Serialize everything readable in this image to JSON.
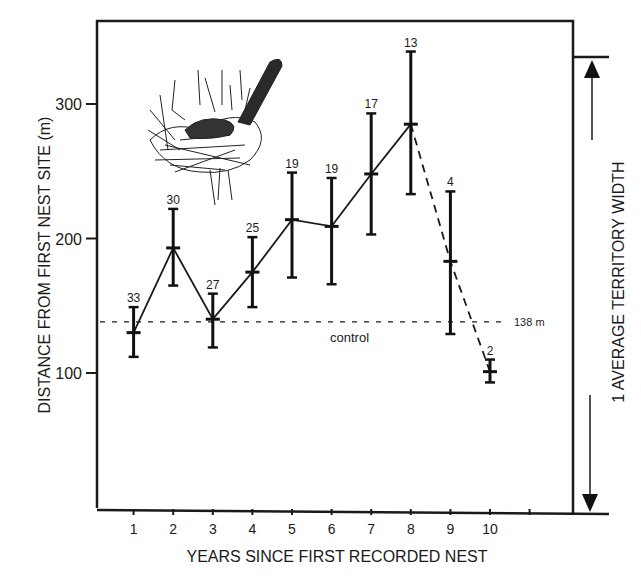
{
  "chart_data": {
    "type": "line",
    "title": "",
    "xlabel": "YEARS SINCE FIRST RECORDED NEST",
    "ylabel": "DISTANCE FROM FIRST NEST SITE (m)",
    "x": [
      1,
      2,
      3,
      4,
      5,
      6,
      7,
      8,
      9,
      10
    ],
    "x_ticks": [
      "1",
      "2",
      "3",
      "4",
      "5",
      "6",
      "7",
      "8",
      "9",
      "10",
      ""
    ],
    "y_ticks": [
      100,
      200,
      300
    ],
    "ylim": [
      0,
      360
    ],
    "xlim": [
      0,
      11.5
    ],
    "grid": false,
    "series": [
      {
        "name": "mean distance",
        "values": [
          130,
          193,
          140,
          175,
          214,
          209,
          248,
          285,
          183,
          101
        ],
        "error_upper": [
          149,
          222,
          159,
          201,
          249,
          245,
          293,
          339,
          235,
          110
        ],
        "error_lower": [
          112,
          165,
          119,
          149,
          171,
          166,
          203,
          233,
          129,
          93
        ],
        "sample_sizes": [
          "33",
          "30",
          "27",
          "25",
          "19",
          "19",
          "17",
          "13",
          "4",
          "2"
        ],
        "line_style": "solid for years 1-8, dashed for years 8-10"
      }
    ],
    "reference_lines": [
      {
        "label": "control",
        "value": 138,
        "value_label": "138 m",
        "style": "dashed"
      }
    ],
    "annotations": [
      {
        "text": "1 AVERAGE TERRITORY WIDTH",
        "type": "vertical double arrow",
        "from": 0,
        "to": 336
      }
    ],
    "illustration": "bird sitting in nest"
  }
}
